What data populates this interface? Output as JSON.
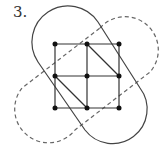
{
  "figure": {
    "label": "3.",
    "grid": {
      "rows": 3,
      "cols": 3,
      "edges": "square grid with two diagonals (top-middle to middle-right, middle-left to bottom-middle)"
    },
    "shapes": [
      {
        "name": "solid-capsule",
        "style": "solid",
        "orientation": "top-left to bottom-right"
      },
      {
        "name": "dashed-capsule",
        "style": "dashed",
        "orientation": "top-right to bottom-left"
      }
    ],
    "colors": {
      "line": "#444444",
      "point": "#111111",
      "dashed": "#666666"
    }
  }
}
